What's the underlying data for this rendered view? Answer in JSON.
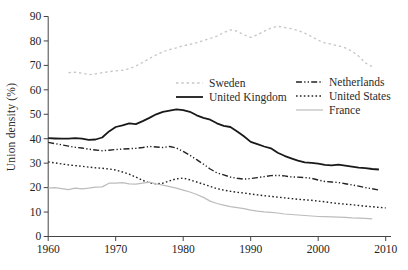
{
  "chart_data": {
    "type": "line",
    "title": "",
    "ylabel": "Union density (%)",
    "xlabel": "",
    "grid": false,
    "legend_position": "inside-top, two columns overlaying plot",
    "x_axis": {
      "min": 1960,
      "max": 2010,
      "ticks": [
        1960,
        1970,
        1980,
        1990,
        2000,
        2010
      ]
    },
    "y_axis": {
      "min": 0,
      "max": 90,
      "ticks": [
        0,
        10,
        20,
        30,
        40,
        50,
        60,
        70,
        80,
        90
      ]
    },
    "legend": {
      "column1": [
        "Sweden",
        "United Kingdom"
      ],
      "column2": [
        "Netherlands",
        "United States",
        "France"
      ]
    },
    "series": [
      {
        "name": "Sweden",
        "color": "#c6c6c6",
        "style": "dotted",
        "width": 1.3,
        "legend_column": 1,
        "start_year": 1963,
        "values": [
          67,
          67.2,
          66.8,
          66.2,
          66.5,
          67,
          67.4,
          67.8,
          68,
          68.6,
          69.8,
          71.2,
          72.8,
          74.3,
          75.6,
          76.5,
          77.2,
          78,
          78.6,
          79.3,
          80.2,
          81,
          82,
          83.4,
          84.5,
          84,
          82.5,
          81.5,
          82.5,
          84,
          85.3,
          86,
          85.5,
          85,
          84.3,
          83.2,
          81.8,
          80.3,
          79.2,
          78.6,
          78,
          77.2,
          75.8,
          73.8,
          71,
          69.5
        ]
      },
      {
        "name": "United Kingdom",
        "color": "#191919",
        "style": "solid",
        "width": 1.8,
        "legend_column": 1,
        "start_year": 1960,
        "values": [
          40.2,
          40.1,
          40,
          40,
          40.2,
          40,
          39.5,
          39.7,
          40.5,
          43,
          44.8,
          45.5,
          46.3,
          46,
          47.2,
          48.5,
          50,
          51,
          51.5,
          52,
          51.7,
          51,
          49.6,
          48.5,
          47.8,
          46.3,
          45.3,
          44.8,
          43,
          41,
          38.7,
          37.8,
          36.8,
          36.1,
          34.3,
          33,
          32,
          31,
          30.3,
          30.1,
          29.8,
          29.3,
          29.1,
          29.4,
          29,
          28.6,
          28.2,
          28,
          27.6,
          27.4
        ]
      },
      {
        "name": "Netherlands",
        "color": "#232323",
        "style": "dash-dot-dot",
        "width": 1.4,
        "legend_column": 2,
        "start_year": 1960,
        "values": [
          38.5,
          38,
          37.5,
          37,
          36.5,
          36.2,
          35.7,
          35.4,
          35.1,
          35.3,
          35.6,
          35.8,
          35.9,
          36.1,
          36.4,
          36.8,
          36.6,
          36.4,
          36.8,
          36.2,
          34.8,
          33.2,
          31.4,
          29.6,
          27.6,
          26,
          25.2,
          24.3,
          23.8,
          23.5,
          23.7,
          24.1,
          24.5,
          24.9,
          25,
          24.8,
          24.4,
          24.3,
          24.1,
          23.8,
          23.1,
          22.5,
          22.3,
          22.1,
          21.6,
          21.1,
          20.6,
          20,
          19.5,
          19
        ]
      },
      {
        "name": "United States",
        "color": "#232323",
        "style": "dotted-fine",
        "width": 1.4,
        "legend_column": 2,
        "start_year": 1960,
        "values": [
          30.5,
          30.1,
          29.7,
          29.3,
          29,
          28.7,
          28.4,
          28.1,
          27.9,
          27.6,
          27.2,
          26.4,
          25.5,
          24.3,
          23,
          21.9,
          21.5,
          21.8,
          22.8,
          23.6,
          23.9,
          23.2,
          22.3,
          21.4,
          20.5,
          19.6,
          19,
          18.5,
          18.1,
          17.8,
          17.4,
          17,
          16.7,
          16.4,
          16.1,
          15.8,
          15.5,
          15.2,
          15,
          14.8,
          14.5,
          14.2,
          13.8,
          13.5,
          13.2,
          13,
          12.7,
          12.4,
          12.2,
          11.9,
          11.7
        ]
      },
      {
        "name": "France",
        "color": "#bcbcbc",
        "style": "solid",
        "width": 1.2,
        "legend_column": 2,
        "start_year": 1960,
        "values": [
          19.8,
          20,
          19.6,
          19.2,
          19.8,
          19.5,
          19.8,
          20.2,
          20.3,
          21.8,
          21.8,
          22,
          21.5,
          21.4,
          21.8,
          22.2,
          21.5,
          21,
          20.4,
          19.8,
          19,
          18.2,
          17.2,
          16,
          14.5,
          13.5,
          12.8,
          12.2,
          11.8,
          11.4,
          10.8,
          10.4,
          10.1,
          9.9,
          9.6,
          9.2,
          9,
          8.8,
          8.6,
          8.4,
          8.2,
          8.1,
          8,
          7.9,
          7.8,
          7.6,
          7.5,
          7.4,
          7.2
        ]
      }
    ]
  }
}
